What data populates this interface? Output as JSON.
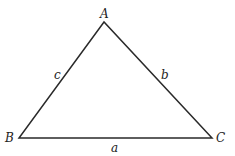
{
  "diagram": {
    "type": "triangle",
    "vertices": [
      {
        "id": "A",
        "label": "A"
      },
      {
        "id": "B",
        "label": "B"
      },
      {
        "id": "C",
        "label": "C"
      }
    ],
    "sides": [
      {
        "id": "a",
        "label": "a",
        "between": [
          "B",
          "C"
        ]
      },
      {
        "id": "b",
        "label": "b",
        "between": [
          "A",
          "C"
        ]
      },
      {
        "id": "c",
        "label": "c",
        "between": [
          "A",
          "B"
        ]
      }
    ],
    "colors": {
      "stroke": "#2a2a2a",
      "text": "#222222",
      "background": "#ffffff"
    }
  }
}
